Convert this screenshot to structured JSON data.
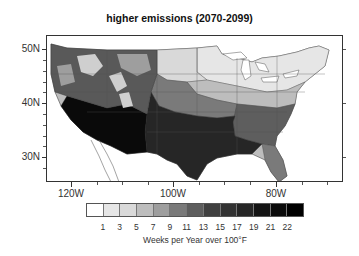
{
  "title": "higher emissions (2070-2099)",
  "axes": {
    "y_labels": [
      {
        "text": "50N",
        "y": 49
      },
      {
        "text": "40N",
        "y": 103
      },
      {
        "text": "30N",
        "y": 157
      }
    ],
    "x_labels": [
      {
        "text": "120W",
        "x": 71
      },
      {
        "text": "100W",
        "x": 173
      },
      {
        "text": "80W",
        "x": 276
      }
    ]
  },
  "colorbar": {
    "title": "Weeks per Year over 100°F",
    "tick_labels": [
      "1",
      "3",
      "5",
      "7",
      "9",
      "11",
      "13",
      "15",
      "17",
      "19",
      "21",
      "22"
    ],
    "colors": [
      "#ffffff",
      "#e6e6e6",
      "#d9d9d9",
      "#bdbdbd",
      "#9e9e9e",
      "#7a7a7a",
      "#5e5e5e",
      "#404040",
      "#333333",
      "#262626",
      "#141414",
      "#0a0a0a",
      "#000000"
    ]
  },
  "chart_data": {
    "type": "heatmap",
    "title": "higher emissions (2070-2099)",
    "xlabel": "Longitude",
    "ylabel": "Latitude",
    "x_ticks": [
      "120W",
      "100W",
      "80W"
    ],
    "y_ticks": [
      "30N",
      "40N",
      "50N"
    ],
    "xlim": [
      "~125W",
      "~67W"
    ],
    "ylim": [
      "~25N",
      "~52N"
    ],
    "colorbar_label": "Weeks per Year over 100°F",
    "colorbar_ticks": [
      1,
      3,
      5,
      7,
      9,
      11,
      13,
      15,
      17,
      19,
      21,
      22
    ],
    "regions": [
      {
        "region": "Pacific Northwest / Northern Rockies",
        "approx_weeks": "1-7 (mixed, high terrain variability)"
      },
      {
        "region": "California Central Valley / Desert Southwest",
        "approx_weeks": "19-22+"
      },
      {
        "region": "Southern Plains (Texas, Oklahoma)",
        "approx_weeks": "17-22"
      },
      {
        "region": "Central Plains (Kansas, Missouri)",
        "approx_weeks": "11-15"
      },
      {
        "region": "Northern Plains / Upper Midwest",
        "approx_weeks": "3-7"
      },
      {
        "region": "Southeast (Gulf states)",
        "approx_weeks": "9-15"
      },
      {
        "region": "Mid-Atlantic / Ohio Valley",
        "approx_weeks": "5-9"
      },
      {
        "region": "Northeast / Great Lakes",
        "approx_weeks": "1-5"
      },
      {
        "region": "Florida",
        "approx_weeks": "7-11"
      }
    ]
  }
}
